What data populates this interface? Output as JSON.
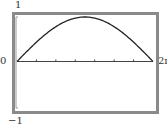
{
  "chart_data": {
    "type": "line",
    "title": "",
    "xlabel": "",
    "ylabel": "",
    "xlim": [
      0,
      6.283
    ],
    "ylim": [
      -1,
      1
    ],
    "x_tick_labels": [
      "0",
      "2π"
    ],
    "y_tick_labels": [
      "1",
      "-1"
    ],
    "x_ticks_count": 7,
    "grid": false,
    "series": [
      {
        "name": "y = sin(x/2)",
        "x": [
          0,
          0.785,
          1.571,
          2.356,
          3.142,
          3.927,
          4.712,
          5.498,
          6.283
        ],
        "values": [
          0,
          0.383,
          0.707,
          0.924,
          1.0,
          0.924,
          0.707,
          0.383,
          0
        ]
      }
    ]
  },
  "labels": {
    "y_max": "1",
    "y_min": "−1",
    "x_min": "0",
    "x_max": "2π"
  },
  "colors": {
    "frame": "#8a8a8a",
    "curve": "#222222",
    "axis": "#444444"
  }
}
